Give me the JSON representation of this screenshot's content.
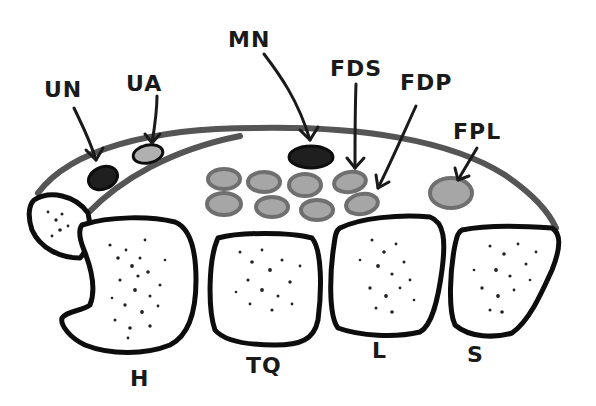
{
  "diagram": {
    "colors": {
      "outline": "#0d0d0d",
      "band": "#555555",
      "tendon_fill": "#a6a6a6",
      "tendon_stroke": "#6f6f6f",
      "nerve_dark": "#1f1f1f",
      "artery_fill": "#b0b0b0",
      "bone_fill": "#ffffff",
      "dots": "#222222"
    },
    "labels": {
      "un": "UN",
      "ua": "UA",
      "mn": "MN",
      "fds": "FDS",
      "fdp": "FDP",
      "fpl": "FPL",
      "h": "H",
      "tq": "TQ",
      "l": "L",
      "s": "S"
    },
    "structures": [
      {
        "key": "un",
        "name": "Ulnar nerve",
        "shape": "dark-oval"
      },
      {
        "key": "ua",
        "name": "Ulnar artery",
        "shape": "light-oval"
      },
      {
        "key": "mn",
        "name": "Median nerve",
        "shape": "dark-oval"
      },
      {
        "key": "fds",
        "name": "Flexor digitorum superficialis",
        "shape": "tendon-group"
      },
      {
        "key": "fdp",
        "name": "Flexor digitorum profundus",
        "shape": "tendon-group"
      },
      {
        "key": "fpl",
        "name": "Flexor pollicis longus",
        "shape": "tendon"
      },
      {
        "key": "h",
        "name": "Hamate",
        "shape": "bone"
      },
      {
        "key": "tq",
        "name": "Triquetrum/Trapezoid",
        "shape": "bone"
      },
      {
        "key": "l",
        "name": "Lunate",
        "shape": "bone"
      },
      {
        "key": "s",
        "name": "Scaphoid",
        "shape": "bone"
      }
    ]
  }
}
